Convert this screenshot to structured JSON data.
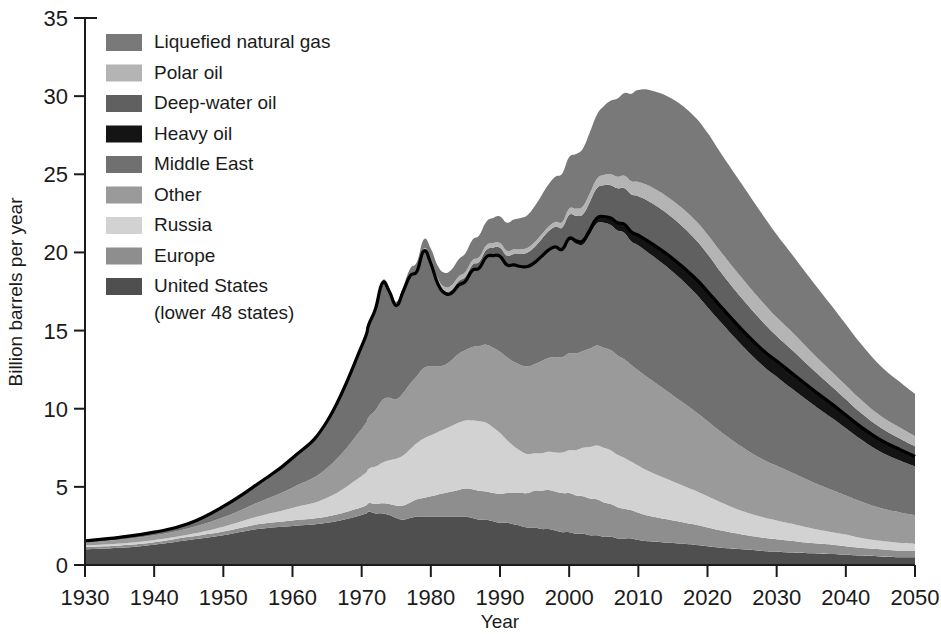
{
  "chart_data": {
    "type": "area",
    "title": "",
    "subtitle": "",
    "xlabel": "Year",
    "ylabel": "Billion barrels per year",
    "xlim": [
      1930,
      2050
    ],
    "ylim": [
      0,
      35
    ],
    "xticks": [
      1930,
      1940,
      1950,
      1960,
      1970,
      1980,
      1990,
      2000,
      2010,
      2020,
      2030,
      2040,
      2050
    ],
    "yticks": [
      0,
      5,
      10,
      15,
      20,
      25,
      30,
      35
    ],
    "grid": false,
    "legend_position": "top-left",
    "stacked": true,
    "stack_order_bottom_to_top": [
      "United  States\n(lower 48 states)",
      "Europe",
      "Russia",
      "Other",
      "Middle East",
      "Heavy oil",
      "Deep-water oil",
      "Polar oil",
      "Liquefied natural gas"
    ],
    "x": [
      1930,
      1935,
      1940,
      1945,
      1950,
      1955,
      1960,
      1965,
      1970,
      1971,
      1972,
      1973,
      1974,
      1975,
      1976,
      1977,
      1978,
      1979,
      1980,
      1981,
      1982,
      1983,
      1984,
      1985,
      1986,
      1987,
      1988,
      1989,
      1990,
      1991,
      1992,
      1993,
      1994,
      1995,
      1996,
      1997,
      1998,
      1999,
      2000,
      2001,
      2002,
      2003,
      2004,
      2005,
      2006,
      2007,
      2008,
      2009,
      2010,
      2012,
      2015,
      2018,
      2020,
      2022,
      2025,
      2028,
      2030,
      2032,
      2035,
      2038,
      2040,
      2042,
      2045,
      2048,
      2050
    ],
    "series": [
      {
        "name": "United  States (lower 48 states)",
        "color": "#4f4f4f",
        "values": [
          1.0,
          1.1,
          1.3,
          1.6,
          1.9,
          2.3,
          2.5,
          2.7,
          3.2,
          3.4,
          3.3,
          3.3,
          3.2,
          3.0,
          2.9,
          3.0,
          3.1,
          3.1,
          3.1,
          3.1,
          3.1,
          3.1,
          3.1,
          3.1,
          3.0,
          2.9,
          2.9,
          2.8,
          2.7,
          2.7,
          2.6,
          2.5,
          2.4,
          2.4,
          2.3,
          2.3,
          2.2,
          2.1,
          2.1,
          2.0,
          2.0,
          1.9,
          1.9,
          1.8,
          1.8,
          1.7,
          1.7,
          1.7,
          1.6,
          1.5,
          1.4,
          1.3,
          1.2,
          1.1,
          1.0,
          0.9,
          0.85,
          0.8,
          0.75,
          0.7,
          0.65,
          0.6,
          0.55,
          0.5,
          0.5
        ]
      },
      {
        "name": "Europe",
        "color": "#8e8e8e",
        "values": [
          0.15,
          0.15,
          0.15,
          0.2,
          0.25,
          0.3,
          0.35,
          0.4,
          0.5,
          0.55,
          0.6,
          0.65,
          0.7,
          0.8,
          0.9,
          1.0,
          1.1,
          1.2,
          1.3,
          1.4,
          1.5,
          1.6,
          1.7,
          1.8,
          1.85,
          1.85,
          1.8,
          1.8,
          1.85,
          1.9,
          2.0,
          2.1,
          2.2,
          2.35,
          2.45,
          2.5,
          2.5,
          2.5,
          2.5,
          2.45,
          2.4,
          2.35,
          2.3,
          2.2,
          2.1,
          2.0,
          1.9,
          1.8,
          1.75,
          1.6,
          1.45,
          1.3,
          1.2,
          1.1,
          0.95,
          0.85,
          0.8,
          0.75,
          0.65,
          0.6,
          0.55,
          0.5,
          0.45,
          0.4,
          0.4
        ]
      },
      {
        "name": "Russia",
        "color": "#d2d2d2",
        "values": [
          0.1,
          0.12,
          0.15,
          0.15,
          0.3,
          0.5,
          0.8,
          1.2,
          2.0,
          2.2,
          2.4,
          2.6,
          2.8,
          3.0,
          3.2,
          3.4,
          3.6,
          3.8,
          3.9,
          4.0,
          4.1,
          4.2,
          4.3,
          4.35,
          4.4,
          4.45,
          4.4,
          4.2,
          3.9,
          3.4,
          3.0,
          2.7,
          2.5,
          2.4,
          2.4,
          2.45,
          2.5,
          2.6,
          2.75,
          2.9,
          3.1,
          3.3,
          3.45,
          3.5,
          3.45,
          3.35,
          3.25,
          3.1,
          3.0,
          2.8,
          2.5,
          2.2,
          2.0,
          1.8,
          1.5,
          1.3,
          1.2,
          1.1,
          0.95,
          0.8,
          0.75,
          0.65,
          0.55,
          0.5,
          0.45
        ]
      },
      {
        "name": "Other",
        "color": "#9a9a9a",
        "values": [
          0.2,
          0.25,
          0.3,
          0.4,
          0.6,
          0.9,
          1.3,
          1.9,
          3.0,
          3.3,
          3.6,
          4.0,
          4.0,
          3.8,
          4.0,
          4.2,
          4.3,
          4.5,
          4.4,
          4.2,
          4.1,
          4.2,
          4.4,
          4.5,
          4.7,
          4.8,
          5.0,
          5.1,
          5.2,
          5.3,
          5.4,
          5.5,
          5.6,
          5.7,
          5.9,
          6.0,
          6.1,
          6.1,
          6.2,
          6.2,
          6.2,
          6.3,
          6.4,
          6.4,
          6.4,
          6.35,
          6.3,
          6.2,
          6.1,
          5.9,
          5.5,
          5.1,
          4.8,
          4.5,
          4.1,
          3.7,
          3.5,
          3.3,
          3.0,
          2.7,
          2.5,
          2.35,
          2.1,
          1.95,
          1.85
        ]
      },
      {
        "name": "Middle East",
        "color": "#707070",
        "values": [
          0.1,
          0.15,
          0.2,
          0.3,
          0.7,
          1.2,
          1.9,
          3.0,
          5.3,
          5.9,
          6.5,
          7.5,
          6.8,
          6.0,
          6.5,
          6.9,
          6.7,
          7.5,
          6.6,
          5.3,
          4.6,
          4.3,
          4.4,
          4.4,
          4.9,
          5.0,
          5.6,
          5.9,
          6.1,
          5.9,
          6.2,
          6.3,
          6.4,
          6.5,
          6.7,
          6.9,
          7.0,
          6.8,
          7.2,
          7.0,
          6.8,
          7.3,
          7.8,
          8.0,
          8.0,
          8.0,
          8.1,
          7.9,
          8.0,
          8.0,
          7.9,
          7.6,
          7.3,
          7.0,
          6.5,
          6.0,
          5.7,
          5.4,
          5.0,
          4.6,
          4.3,
          4.0,
          3.6,
          3.3,
          3.1
        ]
      },
      {
        "name": "Heavy oil",
        "color": "#141414",
        "values": [
          0,
          0,
          0,
          0,
          0,
          0,
          0,
          0,
          0,
          0,
          0,
          0,
          0,
          0,
          0,
          0,
          0,
          0,
          0,
          0,
          0,
          0,
          0,
          0,
          0,
          0,
          0,
          0,
          0,
          0,
          0,
          0,
          0,
          0,
          0,
          0,
          0.05,
          0.1,
          0.15,
          0.2,
          0.25,
          0.3,
          0.35,
          0.4,
          0.45,
          0.5,
          0.55,
          0.6,
          0.65,
          0.75,
          0.85,
          0.95,
          1.0,
          1.0,
          1.0,
          1.0,
          1.0,
          1.0,
          0.95,
          0.9,
          0.85,
          0.8,
          0.75,
          0.7,
          0.65
        ]
      },
      {
        "name": "Deep-water oil",
        "color": "#606060",
        "values": [
          0,
          0,
          0,
          0,
          0,
          0,
          0,
          0,
          0,
          0,
          0,
          0,
          0,
          0,
          0,
          0,
          0,
          0,
          0.05,
          0.1,
          0.15,
          0.2,
          0.25,
          0.3,
          0.35,
          0.4,
          0.45,
          0.5,
          0.55,
          0.6,
          0.7,
          0.8,
          0.9,
          1.0,
          1.1,
          1.2,
          1.3,
          1.4,
          1.5,
          1.6,
          1.7,
          1.8,
          1.9,
          2.0,
          2.1,
          2.2,
          2.3,
          2.4,
          2.5,
          2.6,
          2.6,
          2.5,
          2.4,
          2.2,
          2.0,
          1.8,
          1.6,
          1.5,
          1.3,
          1.1,
          1.0,
          0.9,
          0.8,
          0.7,
          0.65
        ]
      },
      {
        "name": "Polar oil",
        "color": "#b4b4b4",
        "values": [
          0,
          0,
          0,
          0,
          0,
          0,
          0,
          0,
          0,
          0,
          0,
          0,
          0,
          0,
          0,
          0.05,
          0.1,
          0.15,
          0.2,
          0.25,
          0.25,
          0.3,
          0.3,
          0.3,
          0.3,
          0.3,
          0.3,
          0.3,
          0.3,
          0.3,
          0.3,
          0.3,
          0.3,
          0.3,
          0.3,
          0.3,
          0.3,
          0.35,
          0.4,
          0.45,
          0.5,
          0.55,
          0.6,
          0.65,
          0.7,
          0.75,
          0.8,
          0.85,
          0.9,
          1.0,
          1.1,
          1.2,
          1.25,
          1.3,
          1.3,
          1.25,
          1.2,
          1.15,
          1.05,
          0.95,
          0.9,
          0.85,
          0.75,
          0.7,
          0.65
        ]
      },
      {
        "name": "Liquefied natural gas",
        "color": "#797979",
        "values": [
          0,
          0,
          0,
          0,
          0,
          0,
          0,
          0,
          0,
          0,
          0.1,
          0.15,
          0.2,
          0.25,
          0.3,
          0.4,
          0.5,
          0.6,
          0.7,
          0.8,
          0.9,
          1.0,
          1.1,
          1.2,
          1.3,
          1.4,
          1.5,
          1.6,
          1.7,
          1.8,
          1.9,
          2.0,
          2.1,
          2.3,
          2.5,
          2.7,
          2.9,
          3.1,
          3.3,
          3.5,
          3.7,
          3.9,
          4.1,
          4.4,
          4.7,
          5.0,
          5.3,
          5.6,
          5.9,
          6.2,
          6.5,
          6.6,
          6.5,
          6.3,
          6.0,
          5.6,
          5.3,
          5.0,
          4.6,
          4.2,
          3.9,
          3.6,
          3.2,
          2.9,
          2.7
        ]
      }
    ]
  },
  "legend": {
    "items": [
      {
        "label": "Liquefied natural gas",
        "color": "#797979"
      },
      {
        "label": "Polar oil",
        "color": "#b4b4b4"
      },
      {
        "label": "Deep-water oil",
        "color": "#606060"
      },
      {
        "label": "Heavy oil",
        "color": "#141414"
      },
      {
        "label": "Middle East",
        "color": "#707070"
      },
      {
        "label": "Other",
        "color": "#9a9a9a"
      },
      {
        "label": "Russia",
        "color": "#d2d2d2"
      },
      {
        "label": "Europe",
        "color": "#8e8e8e"
      },
      {
        "label": "United  States",
        "color": "#4f4f4f"
      }
    ],
    "last_item_second_line": "(lower 48 states)"
  },
  "axes": {
    "x_title": "Year",
    "y_title": "Billion barrels per year",
    "x_tick_labels": [
      "1930",
      "1940",
      "1950",
      "1960",
      "1970",
      "1980",
      "1990",
      "2000",
      "2010",
      "2020",
      "2030",
      "2040",
      "2050"
    ],
    "y_tick_labels": [
      "0",
      "5",
      "10",
      "15",
      "20",
      "25",
      "30",
      "35"
    ]
  }
}
